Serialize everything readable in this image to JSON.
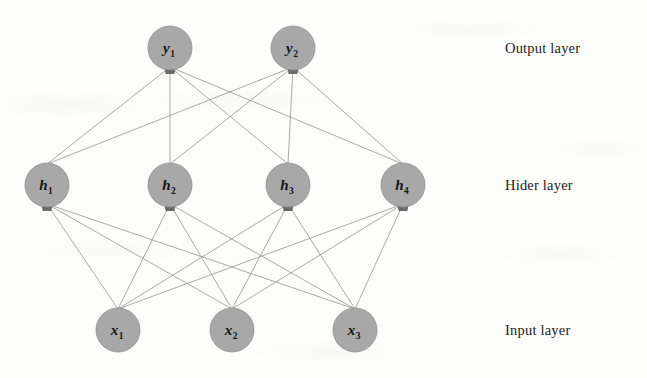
{
  "diagram": {
    "background_color": "#fdfdfc",
    "node_fill_color": "#a8a8a8",
    "node_stroke_color": "#8e8e8e",
    "edge_color": "#9a9a9a",
    "arrowhead_color": "#5a5a5a",
    "label_color": "#1c1c1c",
    "node_radius": 22,
    "connectivity": "fully-connected"
  },
  "layers": [
    {
      "id": "output",
      "label": "Output layer",
      "label_y": 40,
      "y": 48,
      "nodes": [
        {
          "id": "y1",
          "base": "y",
          "sub": "1",
          "x": 170,
          "y": 48
        },
        {
          "id": "y2",
          "base": "y",
          "sub": "2",
          "x": 293,
          "y": 48
        }
      ]
    },
    {
      "id": "hidden",
      "label": "Hider layer",
      "label_y": 177,
      "y": 185,
      "nodes": [
        {
          "id": "h1",
          "base": "h",
          "sub": "1",
          "x": 47,
          "y": 185
        },
        {
          "id": "h2",
          "base": "h",
          "sub": "2",
          "x": 170,
          "y": 185
        },
        {
          "id": "h3",
          "base": "h",
          "sub": "3",
          "x": 288,
          "y": 185
        },
        {
          "id": "h4",
          "base": "h",
          "sub": "4",
          "x": 403,
          "y": 185
        }
      ]
    },
    {
      "id": "input",
      "label": "Input layer",
      "label_y": 322,
      "y": 330,
      "nodes": [
        {
          "id": "x1",
          "base": "x",
          "sub": "1",
          "x": 118,
          "y": 330
        },
        {
          "id": "x2",
          "base": "x",
          "sub": "2",
          "x": 232,
          "y": 330
        },
        {
          "id": "x3",
          "base": "x",
          "sub": "3",
          "x": 355,
          "y": 330
        }
      ]
    }
  ],
  "edges": {
    "input_to_hidden": [
      {
        "from": "x1",
        "to": "h1"
      },
      {
        "from": "x1",
        "to": "h2"
      },
      {
        "from": "x1",
        "to": "h3"
      },
      {
        "from": "x1",
        "to": "h4"
      },
      {
        "from": "x2",
        "to": "h1"
      },
      {
        "from": "x2",
        "to": "h2"
      },
      {
        "from": "x2",
        "to": "h3"
      },
      {
        "from": "x2",
        "to": "h4"
      },
      {
        "from": "x3",
        "to": "h1"
      },
      {
        "from": "x3",
        "to": "h2"
      },
      {
        "from": "x3",
        "to": "h3"
      },
      {
        "from": "x3",
        "to": "h4"
      }
    ],
    "hidden_to_output": [
      {
        "from": "h1",
        "to": "y1"
      },
      {
        "from": "h1",
        "to": "y2"
      },
      {
        "from": "h2",
        "to": "y1"
      },
      {
        "from": "h2",
        "to": "y2"
      },
      {
        "from": "h3",
        "to": "y1"
      },
      {
        "from": "h3",
        "to": "y2"
      },
      {
        "from": "h4",
        "to": "y1"
      },
      {
        "from": "h4",
        "to": "y2"
      }
    ]
  }
}
